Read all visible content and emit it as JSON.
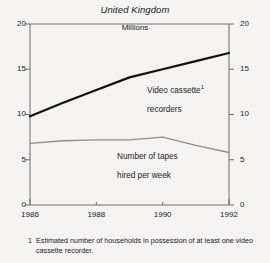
{
  "chart_data": {
    "type": "line",
    "title": "United Kingdom",
    "subtitle": "Millions",
    "xlabel": "",
    "ylabel": "",
    "xlim": [
      1986,
      1992
    ],
    "ylim": [
      0,
      20
    ],
    "xticks": [
      "1986",
      "1988",
      "1990",
      "1992"
    ],
    "xtick_values": [
      1986,
      1988,
      1990,
      1992
    ],
    "yticks_left": [
      "20",
      "15",
      "10",
      "5",
      "0"
    ],
    "yticks_right": [
      "20",
      "15",
      "10",
      "5",
      "0"
    ],
    "ytick_values": [
      20,
      15,
      10,
      5,
      0
    ],
    "grid": false,
    "legend_position": "inline-annotation",
    "x": [
      1986,
      1987,
      1988,
      1989,
      1990,
      1991,
      1992
    ],
    "series": [
      {
        "name": "Video cassette recorders",
        "label_line1": "Video cassette",
        "label_line2": "recorders",
        "footnote_marker": "1",
        "color": "#111111",
        "width": 2.2,
        "values": [
          9.8,
          11.3,
          12.7,
          14.1,
          15.0,
          15.9,
          16.8
        ]
      },
      {
        "name": "Number of tapes hired per week",
        "label_line1": "Number of tapes",
        "label_line2": "hired per week",
        "color": "#8e8e8e",
        "width": 1.3,
        "values": [
          6.8,
          7.1,
          7.2,
          7.2,
          7.5,
          6.6,
          5.8
        ]
      }
    ],
    "footnote": {
      "marker": "1",
      "text": "Estimated number of households in possession of at least one video cassette recorder."
    }
  },
  "colors": {
    "background": "#f4f3f1",
    "axis": "#6f6f6f",
    "text": "#1a1a1a",
    "series_vcr": "#111111",
    "series_tapes": "#8e8e8e"
  }
}
